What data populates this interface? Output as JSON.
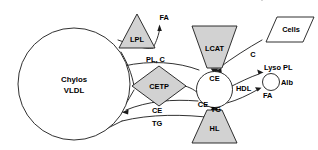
{
  "diagram": {
    "type": "biological-pathway",
    "colors": {
      "background": "#ffffff",
      "stroke": "#1a1a1a",
      "enzyme_fill": "#d2d2d2",
      "particle_fill": "#ffffff"
    },
    "nodes": {
      "chylos_vldl": {
        "label_line1": "Chylos",
        "label_line2": "VLDL",
        "shape": "circle",
        "fill": "white"
      },
      "lpl": {
        "label": "LPL",
        "shape": "triangle-up",
        "fill": "gray"
      },
      "cetp": {
        "label": "CETP",
        "shape": "diamond",
        "fill": "gray"
      },
      "lcat": {
        "label": "LCAT",
        "shape": "trapezoid-down",
        "fill": "gray"
      },
      "hl": {
        "label": "HL",
        "shape": "trapezoid-up",
        "fill": "gray"
      },
      "hdl": {
        "label": "HDL",
        "shape": "circle",
        "fill": "white"
      },
      "cells": {
        "label": "Cells",
        "shape": "parallelogram",
        "fill": "white"
      },
      "alb": {
        "label": "Alb",
        "shape": "circle-small",
        "fill": "white"
      }
    },
    "edge_labels": {
      "fa_lpl": "FA",
      "pl_c": "PL, C",
      "ce_cetp_out": "CE",
      "tg_cetp_out": "TG",
      "ce_hdl_top": "CE",
      "ce_hdl_inner": "CE",
      "tg_hdl": "TG",
      "c_cells": "C",
      "lyso_pl": "Lyso PL",
      "fa_alb": "FA"
    }
  }
}
